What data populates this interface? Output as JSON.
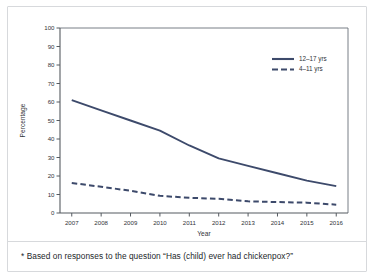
{
  "figure": {
    "footnote": "* Based on responses to the question “Has (child) ever had chickenpox?”",
    "frame_color": "#d7d9dc",
    "background": "#ffffff"
  },
  "chart_data": {
    "type": "line",
    "title": "",
    "xlabel": "Year",
    "ylabel": "Percentage",
    "x": [
      2007,
      2008,
      2009,
      2010,
      2011,
      2012,
      2013,
      2014,
      2015,
      2016
    ],
    "categories": [
      "2007",
      "2008",
      "2009",
      "2010",
      "2011",
      "2012",
      "2013",
      "2014",
      "2015",
      "2016"
    ],
    "xlim": [
      2006.6,
      2016.4
    ],
    "ylim": [
      0,
      100
    ],
    "yticks": [
      0,
      10,
      20,
      30,
      40,
      50,
      60,
      70,
      80,
      90,
      100
    ],
    "ytick_labels": [
      "0",
      "10",
      "20",
      "30",
      "40",
      "50",
      "60",
      "70",
      "80",
      "90",
      "100"
    ],
    "grid": false,
    "legend_position": "top-right",
    "series": [
      {
        "name": "12–17 yrs",
        "style": "solid",
        "color": "#3d4a6b",
        "values": [
          61.0,
          55.5,
          50.0,
          44.5,
          36.5,
          29.5,
          25.5,
          21.5,
          17.5,
          14.5
        ]
      },
      {
        "name": "4–11 yrs",
        "style": "dashed",
        "color": "#3d4a6b",
        "values": [
          16.2,
          14.2,
          12.0,
          9.3,
          8.2,
          7.7,
          6.3,
          5.9,
          5.6,
          4.5
        ]
      }
    ]
  }
}
